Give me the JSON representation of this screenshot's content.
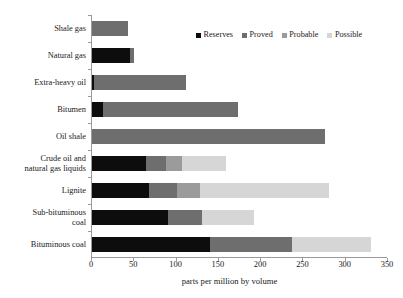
{
  "chart_data": {
    "type": "bar",
    "orientation": "horizontal",
    "stacked": true,
    "title": "",
    "xlabel": "parts per million by volume",
    "ylabel": "",
    "xlim": [
      0,
      350
    ],
    "xticks": [
      0,
      50,
      100,
      150,
      200,
      250,
      300,
      350
    ],
    "grid": false,
    "legend_position": "top-right",
    "categories": [
      "Shale gas",
      "Natural gas",
      "Extra-heavy oil",
      "Bitumen",
      "Oil shale",
      "Crude oil and\nnatural gas liquids",
      "Lignite",
      "Sub-bituminous\ncoal",
      "Bituminous coal"
    ],
    "series": [
      {
        "name": "Reserves",
        "color": "#0d0d0d",
        "values": [
          0,
          45,
          2,
          13,
          0,
          64,
          67,
          90,
          140
        ]
      },
      {
        "name": "Proved",
        "color": "#6e6e6e",
        "values": [
          43,
          5,
          109,
          160,
          275,
          23,
          34,
          40,
          97
        ]
      },
      {
        "name": "Probable",
        "color": "#9b9b9b",
        "values": [
          0,
          0,
          0,
          0,
          0,
          20,
          27,
          0,
          0
        ]
      },
      {
        "name": "Possible",
        "color": "#d6d6d6",
        "values": [
          0,
          0,
          0,
          0,
          0,
          52,
          152,
          61,
          93
        ]
      }
    ],
    "totals": [
      43,
      50,
      111,
      173,
      275,
      159,
      280,
      191,
      330
    ]
  },
  "legend": {
    "entries": [
      {
        "label": "Reserves",
        "color": "#0d0d0d"
      },
      {
        "label": "Proved",
        "color": "#6e6e6e"
      },
      {
        "label": "Probable",
        "color": "#9b9b9b"
      },
      {
        "label": "Possible",
        "color": "#d6d6d6"
      }
    ]
  },
  "axis": {
    "x_title": "parts per million by volume",
    "x_tick_labels": [
      "0",
      "50",
      "100",
      "150",
      "200",
      "250",
      "300",
      "350"
    ]
  }
}
